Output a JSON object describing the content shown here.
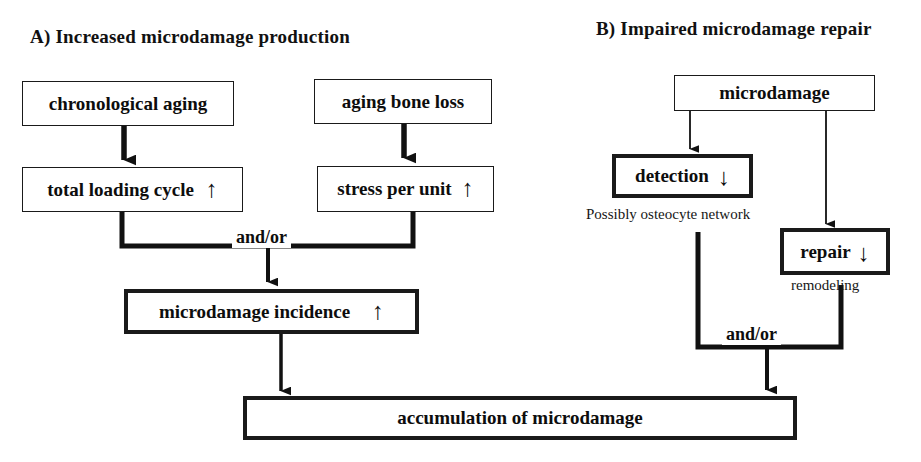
{
  "figure": {
    "panels": [
      {
        "id": "A",
        "title": "A) Increased microdamage production",
        "nodes": [
          {
            "key": "chronological_aging",
            "label": "chronological aging",
            "trend": ""
          },
          {
            "key": "aging_bone_loss",
            "label": "aging bone loss",
            "trend": ""
          },
          {
            "key": "total_loading_cycle",
            "label": "total loading cycle",
            "trend": "↑"
          },
          {
            "key": "stress_per_unit",
            "label": "stress per unit",
            "trend": "↑"
          },
          {
            "key": "microdamage_incidence",
            "label": "microdamage incidence",
            "trend": "↑"
          }
        ],
        "junction_label": "and/or"
      },
      {
        "id": "B",
        "title": "B) Impaired microdamage repair",
        "nodes": [
          {
            "key": "microdamage",
            "label": "microdamage",
            "trend": ""
          },
          {
            "key": "detection",
            "label": "detection",
            "trend": "↓"
          },
          {
            "key": "repair",
            "label": "repair",
            "trend": "↓"
          }
        ],
        "annotations": [
          {
            "key": "detection_note",
            "text": "Possibly osteocyte network"
          },
          {
            "key": "repair_note",
            "text": "remodeling"
          }
        ],
        "junction_label": "and/or"
      }
    ],
    "shared": {
      "outcome_label": "accumulation of microdamage"
    },
    "colors": {
      "ink": "#0d0d0d",
      "background": "#ffffff",
      "line": "#1a1a1a"
    }
  }
}
